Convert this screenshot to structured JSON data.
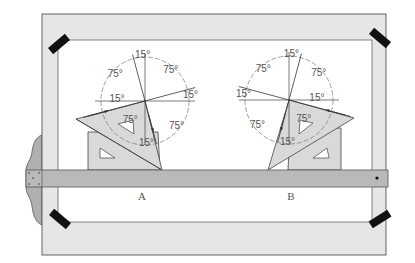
{
  "figure": {
    "views": [
      {
        "id": "A",
        "caption": "A",
        "angle_labels": [
          "15°",
          "75°",
          "15°",
          "75°",
          "15°",
          "75°",
          "15°",
          "75°"
        ]
      },
      {
        "id": "B",
        "caption": "B",
        "angle_labels": [
          "15°",
          "75°",
          "15°",
          "75°",
          "15°",
          "75°",
          "15°",
          "75°"
        ]
      }
    ],
    "components": {
      "board": "drawing-board",
      "tape": "drafting-tape",
      "t_square": "t-square",
      "triangles": [
        "45-degree-triangle",
        "30-60-degree-triangle"
      ]
    },
    "colors": {
      "board_frame": "#e6e6e6",
      "board_edge": "#555555",
      "sheet": "#ffffff",
      "t_square": "#b9b9b9",
      "t_square_head": "#b0b0b0",
      "triangle": "#d9d9d9",
      "tape": "#111111",
      "line": "#444444",
      "text": "#555555"
    }
  }
}
